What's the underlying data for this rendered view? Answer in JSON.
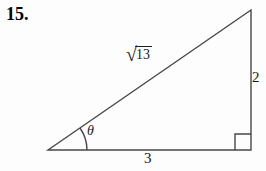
{
  "colors": {
    "background": "#fdfdfd",
    "line": "#474747",
    "text": "#1b1b1b"
  },
  "problem": {
    "number": "15."
  },
  "figure": {
    "angle_label": "θ",
    "hypotenuse_label": {
      "radical_sign": "√",
      "radicand": "13"
    },
    "vertical_side_label": "2",
    "base_side_label": "3"
  }
}
